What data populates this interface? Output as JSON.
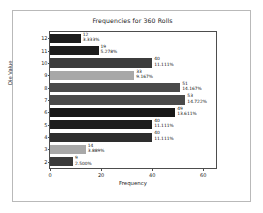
{
  "chart_data": {
    "type": "bar",
    "orientation": "horizontal",
    "title": "Frequencies for 360 Rolls",
    "xlabel": "Frequency",
    "ylabel": "Die Value",
    "xlim": [
      0,
      65
    ],
    "ylim": [
      1.5,
      12.5
    ],
    "xticks": [
      0,
      20,
      40,
      60
    ],
    "grid": false,
    "legend": null,
    "categories": [
      12,
      11,
      10,
      9,
      8,
      7,
      6,
      5,
      4,
      3,
      2
    ],
    "values": [
      12,
      19,
      40,
      33,
      51,
      53,
      49,
      40,
      40,
      14,
      9
    ],
    "total": 360,
    "bars": [
      {
        "category": "12",
        "value": 12,
        "value_label": "12",
        "percent_label": "3.333%",
        "color": "#1c1c1c"
      },
      {
        "category": "11",
        "value": 19,
        "value_label": "19",
        "percent_label": "5.278%",
        "color": "#1c1c1c"
      },
      {
        "category": "10",
        "value": 40,
        "value_label": "40",
        "percent_label": "11.111%",
        "color": "#3c3c3c"
      },
      {
        "category": "9",
        "value": 33,
        "value_label": "33",
        "percent_label": "9.167%",
        "color": "#a8a8a8"
      },
      {
        "category": "8",
        "value": 51,
        "value_label": "51",
        "percent_label": "14.167%",
        "color": "#4a4a4a"
      },
      {
        "category": "7",
        "value": 53,
        "value_label": "53",
        "percent_label": "14.722%",
        "color": "#4a4a4a"
      },
      {
        "category": "6",
        "value": 49,
        "value_label": "49",
        "percent_label": "13.611%",
        "color": "#181818"
      },
      {
        "category": "5",
        "value": 40,
        "value_label": "40",
        "percent_label": "11.111%",
        "color": "#1c1c1c"
      },
      {
        "category": "4",
        "value": 40,
        "value_label": "40",
        "percent_label": "11.111%",
        "color": "#2e2e2e"
      },
      {
        "category": "3",
        "value": 14,
        "value_label": "14",
        "percent_label": "3.889%",
        "color": "#a8a8a8"
      },
      {
        "category": "2",
        "value": 9,
        "value_label": "9",
        "percent_label": "2.500%",
        "color": "#3a3a3a"
      }
    ]
  },
  "figure": {
    "background": "#ffffff",
    "border_color": "#b9b9b9",
    "axis_color": "#4d4d4d",
    "text_color": "#1a1a1a"
  }
}
